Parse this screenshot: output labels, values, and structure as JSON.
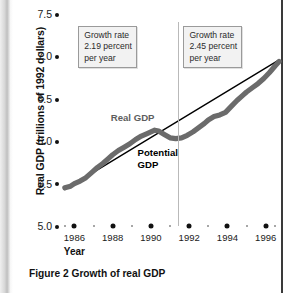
{
  "figure": {
    "caption": "Figure 2  Growth of real GDP"
  },
  "chart_data": {
    "type": "line",
    "title": "Figure 2  Growth of real GDP",
    "xlabel": "Year",
    "ylabel": "Real GDP (trillions of 1992 dollars)",
    "xlim": [
      1985.3,
      1996.8
    ],
    "ylim": [
      5.0,
      7.5
    ],
    "yticks": [
      "5.0",
      "5.5",
      "6.0",
      "6.5",
      "7.0",
      "7.5"
    ],
    "ytick_values": [
      5.0,
      5.5,
      6.0,
      6.5,
      7.0,
      7.5
    ],
    "xticks": [
      "1986",
      "1988",
      "1990",
      "1992",
      "1994",
      "1996"
    ],
    "xtick_values": [
      1986,
      1988,
      1990,
      1992,
      1994,
      1996
    ],
    "xminor_values": [
      1985.5,
      1987,
      1989,
      1991,
      1993,
      1995,
      1996.5
    ],
    "grid": false,
    "legend": "inline-labels",
    "series": [
      {
        "name": "Real GDP",
        "color": "#6b6b6b",
        "points": [
          [
            1985.5,
            5.45
          ],
          [
            1985.8,
            5.47
          ],
          [
            1986.0,
            5.5
          ],
          [
            1986.3,
            5.53
          ],
          [
            1986.6,
            5.57
          ],
          [
            1986.9,
            5.63
          ],
          [
            1987.2,
            5.69
          ],
          [
            1987.5,
            5.74
          ],
          [
            1987.8,
            5.8
          ],
          [
            1988.0,
            5.84
          ],
          [
            1988.3,
            5.89
          ],
          [
            1988.6,
            5.93
          ],
          [
            1988.9,
            5.97
          ],
          [
            1989.2,
            6.02
          ],
          [
            1989.5,
            6.06
          ],
          [
            1989.8,
            6.09
          ],
          [
            1990.0,
            6.11
          ],
          [
            1990.2,
            6.13
          ],
          [
            1990.4,
            6.12
          ],
          [
            1990.7,
            6.08
          ],
          [
            1991.0,
            6.04
          ],
          [
            1991.3,
            6.03
          ],
          [
            1991.6,
            6.04
          ],
          [
            1991.9,
            6.07
          ],
          [
            1992.2,
            6.11
          ],
          [
            1992.5,
            6.16
          ],
          [
            1992.8,
            6.21
          ],
          [
            1993.0,
            6.25
          ],
          [
            1993.3,
            6.29
          ],
          [
            1993.6,
            6.31
          ],
          [
            1993.9,
            6.34
          ],
          [
            1994.2,
            6.41
          ],
          [
            1994.5,
            6.48
          ],
          [
            1994.8,
            6.54
          ],
          [
            1995.0,
            6.58
          ],
          [
            1995.3,
            6.63
          ],
          [
            1995.6,
            6.68
          ],
          [
            1995.9,
            6.74
          ],
          [
            1996.2,
            6.81
          ],
          [
            1996.5,
            6.89
          ],
          [
            1996.7,
            6.94
          ]
        ]
      },
      {
        "name": "Potential GDP",
        "color": "#000000",
        "points": [
          [
            1985.5,
            5.43
          ],
          [
            1996.7,
            6.96
          ]
        ]
      }
    ],
    "annotations": [
      {
        "name": "growth-rate-left",
        "text": "Growth rate\n2.19 percent\nper year",
        "period": "1985-1991",
        "rate_percent": 2.19
      },
      {
        "name": "growth-rate-right",
        "text": "Growth rate\n2.45 percent\nper year",
        "period": "1991-1996",
        "rate_percent": 2.45
      }
    ],
    "divider_x": 1991.4,
    "series_labels": [
      {
        "name": "Real GDP",
        "text": "Real GDP"
      },
      {
        "name": "Potential GDP",
        "text": "Potential\nGDP"
      }
    ]
  },
  "axes": {
    "y_title": "Real GDP (trillions of 1992 dollars)",
    "x_title": "Year"
  },
  "colors": {
    "real_gdp": "#6b6b6b",
    "potential_gdp": "#000000",
    "note_border": "#9a9a9a",
    "note_fill": "#f2f2f2",
    "divider": "#b9b9b9"
  }
}
